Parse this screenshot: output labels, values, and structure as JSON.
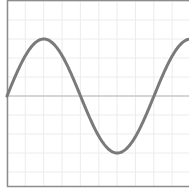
{
  "chart_data": {
    "type": "line",
    "title": "",
    "xlabel": "",
    "ylabel": "",
    "grid": true,
    "legend": null,
    "function": "sine",
    "x": [
      0,
      0.5,
      1.0,
      1.5,
      2.0,
      2.5,
      3.0,
      3.5,
      4.0,
      4.5,
      5.0,
      5.5,
      6.0,
      6.5,
      7.0,
      7.5,
      8.0,
      8.5,
      9.0,
      9.5,
      10.0
    ],
    "series": [
      {
        "name": "sine",
        "values": [
          0,
          0.71,
          1.0,
          0.71,
          0,
          -0.71,
          -1.0,
          -0.71,
          0,
          0.71,
          1.0,
          0.71,
          0,
          -0.71,
          -1.0,
          -0.71,
          0,
          0.71,
          1.0,
          0.71,
          0
        ]
      }
    ],
    "period_px": 147,
    "amplitude_px": 57,
    "xlim": [
      0,
      10
    ],
    "ylim": [
      -1.66,
      1.66
    ],
    "colors": {
      "curve": "#7a7a7a",
      "axis": "#b5b5b5",
      "frame": "#8c8c8c",
      "grid": "#ececec",
      "background": "#ffffff"
    }
  }
}
